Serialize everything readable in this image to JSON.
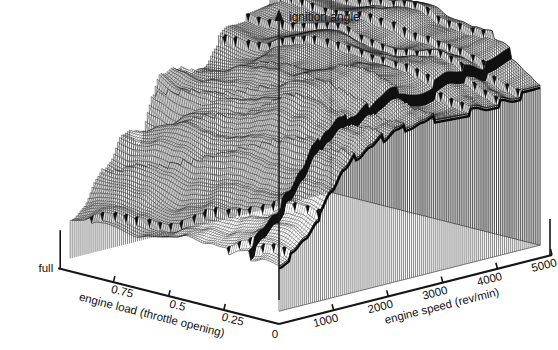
{
  "figure": {
    "kind": "3d-surface-mesh",
    "background": "#ffffff",
    "ink": "#111111"
  },
  "axes": {
    "z": {
      "title": "ignition angle",
      "arrow": "up-arrow-icon",
      "ticks": []
    },
    "x_right": {
      "title": "engine speed (rev/min)",
      "ticks": [
        "1000",
        "2000",
        "3000",
        "4000",
        "5000"
      ],
      "origin_label": "0"
    },
    "y_left": {
      "title": "engine load  (throttle opening)",
      "ticks": [
        "full",
        "0.75",
        "0.5",
        "0.25"
      ],
      "origin_label": "0"
    }
  },
  "chart_data": {
    "type": "surface",
    "title": "",
    "xlabel": "engine speed (rev/min)",
    "ylabel": "engine load  (throttle opening)",
    "zlabel": "ignition angle",
    "xlim": [
      0,
      5000
    ],
    "ylim": [
      0,
      1
    ],
    "grid": false,
    "legend": "none",
    "x_ticks": [
      0,
      1000,
      2000,
      3000,
      4000,
      5000
    ],
    "y_ticks": [
      0,
      0.25,
      0.5,
      0.75,
      1.0
    ],
    "y_tick_labels": [
      "0",
      "0.25",
      "0.5",
      "0.75",
      "full"
    ],
    "x": [
      0,
      250,
      500,
      750,
      1000,
      1250,
      1500,
      1750,
      2000,
      2250,
      2500,
      2750,
      3000,
      3250,
      3500,
      3750,
      4000,
      4250,
      4500,
      4750,
      5000
    ],
    "y": [
      0,
      0.0625,
      0.125,
      0.1875,
      0.25,
      0.3125,
      0.375,
      0.4375,
      0.5,
      0.5625,
      0.625,
      0.6875,
      0.75,
      0.8125,
      0.875,
      0.9375,
      1.0
    ],
    "z_units": "degrees BTDC",
    "z_range": [
      4,
      46
    ],
    "z": [
      [
        10,
        11,
        13,
        16,
        20,
        24,
        27,
        29,
        31,
        33,
        34,
        35,
        36,
        36,
        36,
        36,
        35,
        35,
        34,
        34,
        34
      ],
      [
        10,
        11,
        14,
        17,
        21,
        25,
        28,
        31,
        33,
        34,
        35,
        36,
        37,
        37,
        37,
        37,
        36,
        36,
        35,
        35,
        35
      ],
      [
        9,
        11,
        14,
        18,
        22,
        26,
        29,
        32,
        34,
        36,
        37,
        38,
        38,
        38,
        38,
        38,
        37,
        37,
        36,
        36,
        36
      ],
      [
        9,
        10,
        13,
        17,
        22,
        27,
        30,
        33,
        35,
        37,
        38,
        39,
        39,
        39,
        39,
        39,
        38,
        38,
        37,
        37,
        37
      ],
      [
        8,
        10,
        13,
        17,
        22,
        27,
        31,
        34,
        36,
        38,
        39,
        40,
        40,
        40,
        40,
        39,
        39,
        38,
        38,
        38,
        38
      ],
      [
        8,
        9,
        12,
        16,
        21,
        26,
        30,
        34,
        37,
        39,
        40,
        41,
        41,
        41,
        40,
        40,
        39,
        39,
        39,
        39,
        39
      ],
      [
        7,
        9,
        11,
        15,
        20,
        25,
        30,
        34,
        37,
        39,
        41,
        42,
        42,
        41,
        41,
        40,
        40,
        40,
        40,
        40,
        40
      ],
      [
        7,
        8,
        11,
        14,
        19,
        24,
        29,
        33,
        37,
        40,
        41,
        42,
        42,
        42,
        41,
        41,
        40,
        40,
        40,
        40,
        40
      ],
      [
        6,
        8,
        10,
        13,
        18,
        23,
        28,
        33,
        36,
        39,
        41,
        42,
        42,
        42,
        41,
        41,
        41,
        41,
        41,
        41,
        41
      ],
      [
        6,
        7,
        10,
        13,
        17,
        22,
        27,
        32,
        36,
        39,
        41,
        42,
        42,
        42,
        42,
        41,
        41,
        41,
        41,
        41,
        41
      ],
      [
        6,
        7,
        9,
        12,
        16,
        21,
        26,
        31,
        35,
        38,
        40,
        41,
        42,
        42,
        42,
        42,
        42,
        42,
        41,
        41,
        41
      ],
      [
        5,
        7,
        9,
        12,
        16,
        20,
        25,
        30,
        34,
        37,
        40,
        41,
        42,
        42,
        42,
        42,
        42,
        42,
        42,
        42,
        42
      ],
      [
        5,
        6,
        9,
        11,
        15,
        20,
        24,
        29,
        33,
        37,
        39,
        41,
        42,
        42,
        42,
        42,
        42,
        42,
        42,
        42,
        42
      ],
      [
        5,
        6,
        8,
        11,
        15,
        19,
        24,
        28,
        33,
        36,
        39,
        40,
        41,
        42,
        42,
        42,
        42,
        42,
        42,
        42,
        42
      ],
      [
        5,
        6,
        8,
        11,
        14,
        19,
        23,
        28,
        32,
        36,
        38,
        40,
        41,
        41,
        42,
        42,
        42,
        42,
        42,
        42,
        42
      ],
      [
        4,
        6,
        8,
        10,
        14,
        18,
        23,
        27,
        32,
        35,
        38,
        40,
        41,
        41,
        41,
        42,
        42,
        42,
        42,
        42,
        42
      ],
      [
        4,
        5,
        8,
        10,
        14,
        18,
        22,
        27,
        31,
        35,
        38,
        40,
        41,
        41,
        41,
        41,
        42,
        42,
        42,
        42,
        42
      ]
    ]
  }
}
